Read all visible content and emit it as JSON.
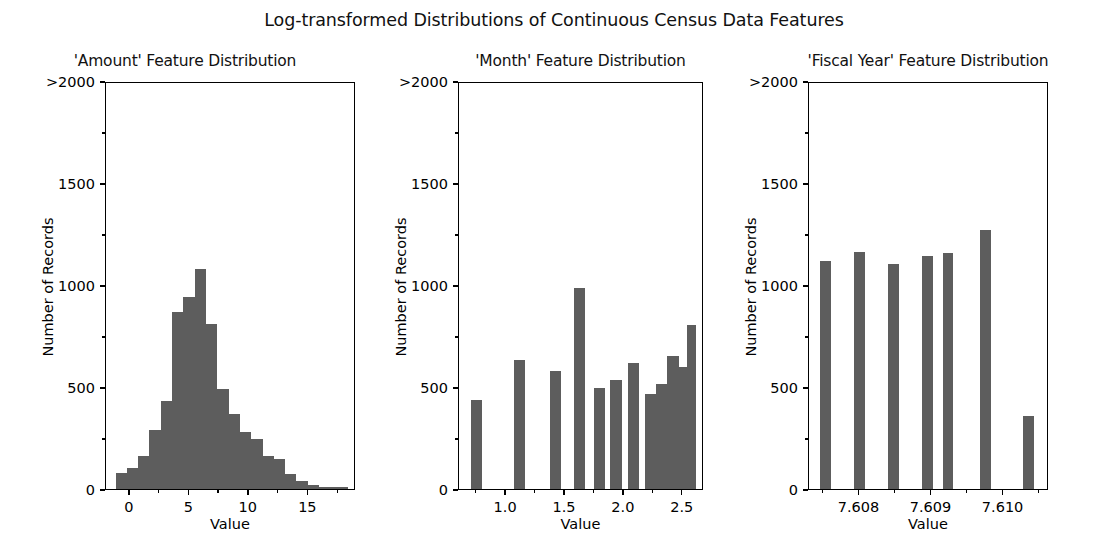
{
  "figure": {
    "suptitle": "Log-transformed Distributions of Continuous Census Data Features",
    "bar_color": "#5d5d5d",
    "background_color": "#ffffff",
    "axis_color": "#000000",
    "width_px": 1108,
    "height_px": 555
  },
  "chart_data": [
    {
      "type": "bar",
      "title": "'Amount' Feature Distribution",
      "xlabel": "Value",
      "ylabel": "Number of Records",
      "grid": false,
      "legend": null,
      "xlim": [
        -2.0,
        19.0
      ],
      "ylim": [
        0,
        2000
      ],
      "ytick_labels": [
        "0",
        "500",
        "1000",
        "1500",
        ">2000"
      ],
      "ytick_values": [
        0,
        500,
        1000,
        1500,
        2000
      ],
      "ytick_minor_values": [
        250,
        750,
        1250,
        1750
      ],
      "xtick_labels": [
        "0",
        "5",
        "10",
        "15"
      ],
      "xtick_values": [
        0,
        5,
        10,
        15
      ],
      "xtick_minor_values": [
        -2.5,
        2.5,
        7.5,
        12.5,
        17.5
      ],
      "bin_edges": [
        -1.2,
        -0.25,
        0.7,
        1.65,
        2.6,
        3.55,
        4.5,
        5.45,
        6.4,
        7.35,
        8.3,
        9.25,
        10.2,
        11.15,
        12.1,
        13.05,
        14.0,
        14.95,
        15.9,
        16.85,
        17.8,
        18.3
      ],
      "bin_centers": [
        -0.72,
        0.22,
        1.17,
        2.12,
        3.07,
        4.02,
        4.97,
        5.92,
        6.87,
        7.82,
        8.77,
        9.72,
        10.67,
        11.62,
        12.57,
        13.52,
        14.47,
        15.42,
        16.37,
        17.32,
        18.05
      ],
      "values": [
        80,
        105,
        160,
        290,
        430,
        870,
        940,
        1080,
        810,
        490,
        370,
        280,
        245,
        160,
        145,
        75,
        40,
        20,
        10,
        8,
        12
      ]
    },
    {
      "type": "bar",
      "title": "'Month' Feature Distribution",
      "xlabel": "Value",
      "ylabel": "Number of Records",
      "grid": false,
      "legend": null,
      "xlim": [
        0.6,
        2.68
      ],
      "ylim": [
        0,
        2000
      ],
      "ytick_labels": [
        "0",
        "500",
        "1000",
        "1500",
        ">2000"
      ],
      "ytick_values": [
        0,
        500,
        1000,
        1500,
        2000
      ],
      "ytick_minor_values": [
        250,
        750,
        1250,
        1750
      ],
      "xtick_labels": [
        "1.0",
        "1.5",
        "2.0",
        "2.5"
      ],
      "xtick_values": [
        1.0,
        1.5,
        2.0,
        2.5
      ],
      "xtick_minor_values": [
        0.75,
        1.25,
        1.75,
        2.25
      ],
      "bin_edges": [
        0.7,
        0.795,
        1.065,
        1.16,
        1.375,
        1.47,
        1.575,
        1.67,
        1.745,
        1.84,
        1.885,
        1.98,
        2.035,
        2.13,
        2.175,
        2.27,
        2.27,
        2.36,
        2.36,
        2.445,
        2.445,
        2.535,
        2.535,
        2.615
      ],
      "bars": [
        {
          "left": 0.7,
          "right": 0.795,
          "value": 435
        },
        {
          "left": 1.065,
          "right": 1.16,
          "value": 630
        },
        {
          "left": 1.375,
          "right": 1.47,
          "value": 580
        },
        {
          "left": 1.575,
          "right": 1.67,
          "value": 985
        },
        {
          "left": 1.745,
          "right": 1.84,
          "value": 495
        },
        {
          "left": 1.885,
          "right": 1.98,
          "value": 535
        },
        {
          "left": 2.035,
          "right": 2.13,
          "value": 620
        },
        {
          "left": 2.18,
          "right": 2.275,
          "value": 465
        },
        {
          "left": 2.275,
          "right": 2.37,
          "value": 515
        },
        {
          "left": 2.37,
          "right": 2.465,
          "value": 650
        },
        {
          "left": 2.465,
          "right": 2.535,
          "value": 600
        },
        {
          "left": 2.535,
          "right": 2.615,
          "value": 805
        }
      ]
    },
    {
      "type": "bar",
      "title": "'Fiscal Year' Feature Distribution",
      "xlabel": "Value",
      "ylabel": "Number of Records",
      "grid": false,
      "legend": null,
      "xlim": [
        7.6073,
        7.61063
      ],
      "ylim": [
        0,
        2000
      ],
      "ytick_labels": [
        "0",
        "500",
        "1000",
        "1500",
        ">2000"
      ],
      "ytick_values": [
        0,
        500,
        1000,
        1500,
        2000
      ],
      "ytick_minor_values": [
        250,
        750,
        1250,
        1750
      ],
      "xtick_labels": [
        "7.608",
        "7.609",
        "7.610"
      ],
      "xtick_values": [
        7.608,
        7.609,
        7.61
      ],
      "xtick_minor_values": [
        7.6075,
        7.6085,
        7.6095,
        7.6105
      ],
      "bars": [
        {
          "center": 7.60753,
          "value": 1120
        },
        {
          "center": 7.608,
          "value": 1160
        },
        {
          "center": 7.60847,
          "value": 1105
        },
        {
          "center": 7.60894,
          "value": 1140
        },
        {
          "center": 7.60923,
          "value": 1155
        },
        {
          "center": 7.60975,
          "value": 1270
        },
        {
          "center": 7.61035,
          "value": 360
        }
      ],
      "bar_width": 0.00015
    }
  ]
}
